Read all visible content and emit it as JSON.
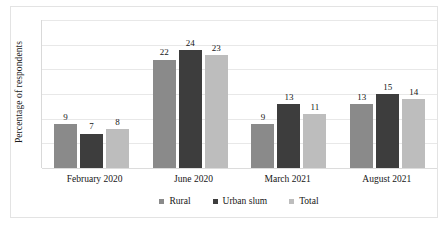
{
  "chart_data": {
    "type": "bar",
    "title": "",
    "subtitle": "",
    "xlabel": "",
    "ylabel": "Percentage of respondents",
    "categories": [
      "February 2020",
      "June 2020",
      "March 2021",
      "August 2021"
    ],
    "series": [
      {
        "name": "Rural",
        "color": "#8a8a8a",
        "values": [
          9,
          22,
          9,
          13
        ]
      },
      {
        "name": "Urban slum",
        "color": "#3d3d3d",
        "values": [
          7,
          24,
          13,
          15
        ]
      },
      {
        "name": "Total",
        "color": "#bdbdbd",
        "values": [
          8,
          23,
          11,
          14
        ]
      }
    ],
    "ylim": [
      0,
      30
    ],
    "y_tick_labels": [],
    "gridlines": 6,
    "grid": true,
    "show_data_labels": true,
    "legend_position": "bottom",
    "frame_color": "#e3e3e3",
    "gridline_color": "#e8e8e8",
    "label_color": "#161616"
  }
}
